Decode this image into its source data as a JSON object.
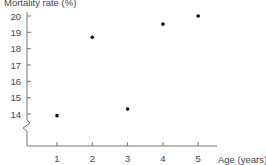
{
  "chart_data": {
    "type": "scatter",
    "title": "",
    "ylabel": "Mortality rate (%)",
    "xlabel": "Age (years)",
    "x": [
      1,
      2,
      3,
      4,
      5
    ],
    "y": [
      13.9,
      18.7,
      14.3,
      19.5,
      20.0
    ],
    "series": [
      {
        "name": "Mortality rate",
        "x": [
          1,
          2,
          3,
          4,
          5
        ],
        "values": [
          13.9,
          18.7,
          14.3,
          19.5,
          20.0
        ]
      }
    ],
    "xticks": [
      "1",
      "2",
      "3",
      "4",
      "5"
    ],
    "yticks": [
      "14",
      "15",
      "16",
      "17",
      "18",
      "19",
      "20"
    ],
    "xlim": [
      0,
      5.5
    ],
    "ylim": [
      12,
      20.3
    ],
    "y_axis_break": true,
    "grid": false,
    "legend": "none"
  },
  "colors": {
    "axis": "#777777",
    "point": "#111111",
    "text": "#444444"
  }
}
